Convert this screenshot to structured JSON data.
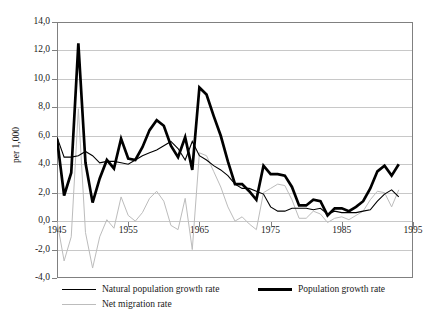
{
  "chart_data": {
    "type": "line",
    "title": "",
    "subtitle": "",
    "xlabel": "",
    "ylabel": "per 1,000",
    "xlim": [
      1945,
      1995
    ],
    "ylim": [
      -4.0,
      14.0
    ],
    "grid": true,
    "legend_position": "bottom-left",
    "y_ticks": [
      "14,0",
      "12,0",
      "10,0",
      "8,0",
      "6,0",
      "4,0",
      "2,0",
      "0,0",
      "-2,0",
      "-4,0"
    ],
    "y_tick_values": [
      14.0,
      12.0,
      10.0,
      8.0,
      6.0,
      4.0,
      2.0,
      0.0,
      -2.0,
      -4.0
    ],
    "x_ticks": [
      "1945",
      "1955",
      "1965",
      "1975",
      "1985",
      "1995"
    ],
    "x_tick_values": [
      1945,
      1955,
      1965,
      1975,
      1985,
      1995
    ],
    "x": [
      1945,
      1946,
      1947,
      1948,
      1949,
      1950,
      1951,
      1952,
      1953,
      1954,
      1955,
      1956,
      1957,
      1958,
      1959,
      1960,
      1961,
      1962,
      1963,
      1964,
      1965,
      1966,
      1967,
      1968,
      1969,
      1970,
      1971,
      1972,
      1973,
      1974,
      1975,
      1976,
      1977,
      1978,
      1979,
      1980,
      1981,
      1982,
      1983,
      1984,
      1985,
      1986,
      1987,
      1988,
      1989,
      1990,
      1991,
      1992,
      1993
    ],
    "series": [
      {
        "name": "Natural population growth rate",
        "color": "#000000",
        "width": "medium",
        "values": [
          5.9,
          4.5,
          4.5,
          4.6,
          4.9,
          4.6,
          4.1,
          4.2,
          4.2,
          4.1,
          4.0,
          4.3,
          4.6,
          4.8,
          5.0,
          5.3,
          5.6,
          5.1,
          4.3,
          5.6,
          4.6,
          4.3,
          3.9,
          3.6,
          3.2,
          2.6,
          2.3,
          2.3,
          2.1,
          1.9,
          1.0,
          0.7,
          0.7,
          0.9,
          0.9,
          0.9,
          0.8,
          0.9,
          0.5,
          0.7,
          0.6,
          0.6,
          0.6,
          0.7,
          0.8,
          1.4,
          1.9,
          2.2,
          1.7
        ]
      },
      {
        "name": "Population growth rate",
        "color": "#000000",
        "width": "thick",
        "values": [
          5.8,
          1.8,
          3.4,
          12.5,
          4.1,
          1.3,
          3.0,
          4.3,
          3.7,
          5.8,
          4.4,
          4.3,
          5.2,
          6.4,
          7.1,
          6.7,
          5.3,
          4.5,
          5.9,
          3.6,
          9.4,
          8.9,
          7.4,
          6.0,
          4.2,
          2.6,
          2.6,
          2.1,
          1.5,
          3.9,
          3.3,
          3.3,
          3.2,
          2.4,
          1.1,
          1.1,
          1.5,
          1.4,
          0.4,
          0.9,
          0.9,
          0.7,
          1.0,
          1.4,
          2.3,
          3.5,
          3.9,
          3.2,
          4.0
        ]
      },
      {
        "name": "Net migration rate",
        "color": "#bcbcbc",
        "width": "thin",
        "values": [
          0.0,
          -2.8,
          -1.1,
          7.9,
          -0.8,
          -3.3,
          -1.1,
          0.1,
          -0.5,
          1.7,
          0.4,
          0.0,
          0.6,
          1.6,
          2.1,
          1.4,
          -0.3,
          -0.6,
          1.6,
          -2.0,
          4.8,
          4.6,
          3.5,
          2.4,
          1.0,
          0.0,
          0.3,
          -0.2,
          -0.6,
          2.0,
          2.3,
          2.6,
          2.5,
          1.5,
          0.2,
          0.2,
          0.7,
          0.5,
          -0.1,
          0.2,
          0.3,
          0.1,
          0.4,
          0.7,
          1.5,
          2.1,
          2.0,
          1.0,
          2.2
        ]
      }
    ]
  },
  "legend": {
    "items": [
      {
        "label": "Natural population growth rate",
        "swatch": "line-swatch-natural"
      },
      {
        "label": "Population growth rate",
        "swatch": "line-swatch-population"
      },
      {
        "label": "Net migration rate",
        "swatch": "line-swatch-migration"
      }
    ]
  }
}
